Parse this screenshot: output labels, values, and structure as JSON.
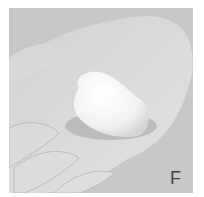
{
  "figure": {
    "panel_label": "F",
    "style": "grayscale photograph",
    "colors": {
      "background": "#c9c9c9",
      "hand": "#dcdcdc",
      "object": "#f8f8f8",
      "border": "#ffffff"
    }
  }
}
